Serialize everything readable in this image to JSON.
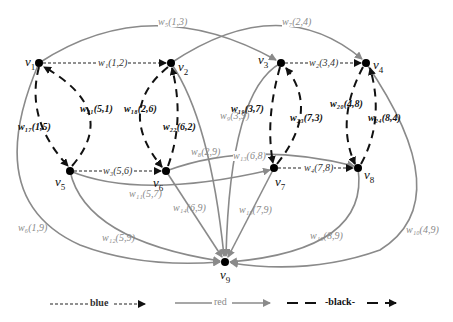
{
  "nodes": [
    {
      "id": "v1",
      "label": "v",
      "sub": "1",
      "x": 39,
      "y": 63
    },
    {
      "id": "v2",
      "label": "v",
      "sub": "2",
      "x": 171,
      "y": 63
    },
    {
      "id": "v3",
      "label": "v",
      "sub": "3",
      "x": 281,
      "y": 63
    },
    {
      "id": "v4",
      "label": "v",
      "sub": "4",
      "x": 366,
      "y": 63
    },
    {
      "id": "v5",
      "label": "v",
      "sub": "5",
      "x": 70,
      "y": 171
    },
    {
      "id": "v6",
      "label": "v",
      "sub": "6",
      "x": 166,
      "y": 171
    },
    {
      "id": "v7",
      "label": "v",
      "sub": "7",
      "x": 274,
      "y": 168
    },
    {
      "id": "v8",
      "label": "v",
      "sub": "8",
      "x": 358,
      "y": 168
    },
    {
      "id": "v9",
      "label": "v",
      "sub": "9",
      "x": 225,
      "y": 262
    }
  ],
  "edges": {
    "blue": [
      {
        "label": "w₁(1,2)",
        "from": "v1",
        "to": "v2"
      },
      {
        "label": "w₂(3,4)",
        "from": "v3",
        "to": "v4"
      },
      {
        "label": "w₃(5,6)",
        "from": "v5",
        "to": "v6"
      },
      {
        "label": "w₄(7,8)",
        "from": "v7",
        "to": "v8"
      }
    ],
    "red": [
      {
        "label": "w₅(1,3)",
        "from": "v1",
        "to": "v3"
      },
      {
        "label": "w₆(1,9)",
        "from": "v1",
        "to": "v9"
      },
      {
        "label": "w₇(2,4)",
        "from": "v2",
        "to": "v4"
      },
      {
        "label": "w₈(2,9)",
        "from": "v2",
        "to": "v9"
      },
      {
        "label": "w₉(3,9)",
        "from": "v3",
        "to": "v9"
      },
      {
        "label": "w₁₀(4,9)",
        "from": "v4",
        "to": "v9"
      },
      {
        "label": "w₁₁(5,7)",
        "from": "v5",
        "to": "v7"
      },
      {
        "label": "w₁₂(5,9)",
        "from": "v5",
        "to": "v9"
      },
      {
        "label": "w₁₃(6,8)",
        "from": "v6",
        "to": "v8"
      },
      {
        "label": "w₁₄(6,9)",
        "from": "v6",
        "to": "v9"
      },
      {
        "label": "w₁₅(7,9)",
        "from": "v7",
        "to": "v9"
      },
      {
        "label": "w₁₆(8,9)",
        "from": "v8",
        "to": "v9"
      }
    ],
    "black": [
      {
        "label": "w₁₇(1,5)",
        "from": "v1",
        "to": "v5"
      },
      {
        "label": "w₁₈(2,6)",
        "from": "v2",
        "to": "v6"
      },
      {
        "label": "w₁₉(3,7)",
        "from": "v3",
        "to": "v7"
      },
      {
        "label": "w₂₀(4,8)",
        "from": "v4",
        "to": "v8"
      },
      {
        "label": "w₂₁(5,1)",
        "from": "v5",
        "to": "v1"
      },
      {
        "label": "w₂₂(6,2)",
        "from": "v6",
        "to": "v2"
      },
      {
        "label": "w₂₃(7,3)",
        "from": "v7",
        "to": "v3"
      },
      {
        "label": "w₂₄(8,4)",
        "from": "v8",
        "to": "v4"
      }
    ]
  },
  "legend": {
    "blue_label": "blue",
    "red_label": "red",
    "black_label": "-black-"
  },
  "colors": {
    "red_edge": "#8a8a8a",
    "blue_edge": "#222222",
    "black_edge": "#111111",
    "node": "#000000"
  }
}
